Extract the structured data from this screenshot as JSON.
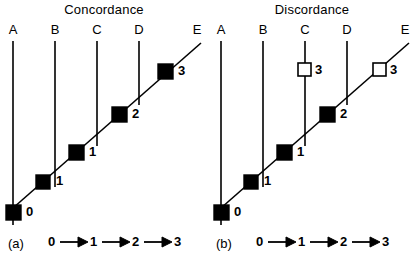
{
  "figure": {
    "type": "diagram"
  },
  "panels": [
    {
      "id": "a",
      "title": "Concordance",
      "panel_label": "(a)",
      "branch_labels": [
        "A",
        "B",
        "C",
        "D",
        "E"
      ],
      "nodes": [
        {
          "label": "0",
          "fill": "solid"
        },
        {
          "label": "1",
          "fill": "solid"
        },
        {
          "label": "1",
          "fill": "solid"
        },
        {
          "label": "2",
          "fill": "solid"
        },
        {
          "label": "3",
          "fill": "solid"
        }
      ],
      "sequence": [
        "0",
        "1",
        "2",
        "3"
      ]
    },
    {
      "id": "b",
      "title": "Discordance",
      "panel_label": "(b)",
      "branch_labels": [
        "A",
        "B",
        "C",
        "D",
        "E"
      ],
      "nodes": [
        {
          "label": "0",
          "fill": "solid"
        },
        {
          "label": "1",
          "fill": "solid"
        },
        {
          "label": "1",
          "fill": "solid"
        },
        {
          "label": "2",
          "fill": "solid"
        },
        {
          "label": "3",
          "fill": "open"
        },
        {
          "label": "3",
          "fill": "open"
        }
      ],
      "sequence": [
        "0",
        "1",
        "2",
        "3"
      ]
    }
  ],
  "colors": {
    "line": "#000000",
    "solid_marker": "#000000",
    "open_marker": "#ffffff",
    "background": "#ffffff"
  }
}
